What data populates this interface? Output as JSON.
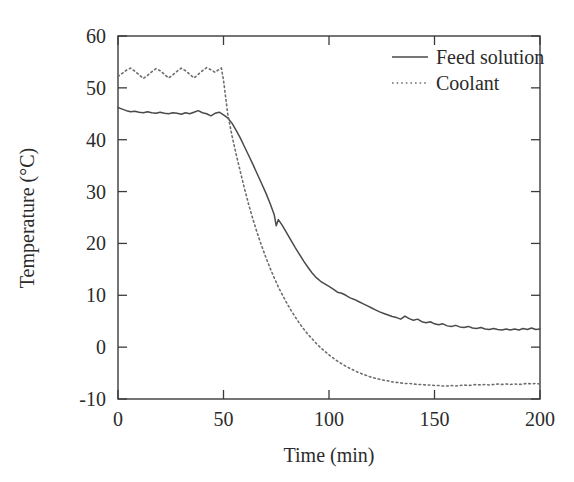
{
  "chart_data": {
    "type": "line",
    "title": "",
    "xlabel": "Time (min)",
    "ylabel": "Temperature (°C)",
    "xlim": [
      0,
      200
    ],
    "ylim": [
      -10,
      60
    ],
    "xticks": [
      0,
      50,
      100,
      150,
      200
    ],
    "yticks": [
      -10,
      0,
      10,
      20,
      30,
      40,
      50,
      60
    ],
    "xtick_labels": [
      "0",
      "50",
      "100",
      "150",
      "200"
    ],
    "ytick_labels": [
      "-10",
      "0",
      "10",
      "20",
      "30",
      "40",
      "50",
      "60"
    ],
    "grid": false,
    "legend_position": "top-right",
    "series": [
      {
        "name": "Feed solution",
        "style": "solid",
        "color": "#4a4a4a",
        "x": [
          0,
          2,
          4,
          6,
          8,
          10,
          12,
          14,
          16,
          18,
          20,
          22,
          24,
          26,
          28,
          30,
          32,
          34,
          36,
          38,
          40,
          42,
          44,
          46,
          48,
          50,
          52,
          54,
          56,
          58,
          60,
          62,
          64,
          66,
          68,
          70,
          72,
          74,
          75,
          76,
          78,
          80,
          82,
          84,
          86,
          88,
          90,
          92,
          94,
          96,
          98,
          100,
          102,
          104,
          106,
          108,
          110,
          112,
          114,
          116,
          118,
          120,
          122,
          124,
          126,
          128,
          130,
          132,
          134,
          136,
          138,
          140,
          142,
          144,
          146,
          148,
          150,
          152,
          154,
          156,
          158,
          160,
          162,
          164,
          166,
          168,
          170,
          172,
          174,
          176,
          178,
          180,
          182,
          184,
          186,
          188,
          190,
          192,
          194,
          196,
          198,
          200
        ],
        "y": [
          46.2,
          45.9,
          45.6,
          45.4,
          45.5,
          45.3,
          45.2,
          45.4,
          45.2,
          45.1,
          45.3,
          45.1,
          45.0,
          45.2,
          45.1,
          44.9,
          45.2,
          45.0,
          45.3,
          45.6,
          45.2,
          45.0,
          44.6,
          45.1,
          45.3,
          44.8,
          44.2,
          43.2,
          41.8,
          40.3,
          38.6,
          36.9,
          35.2,
          33.4,
          31.6,
          29.8,
          27.8,
          25.6,
          23.4,
          24.6,
          23.4,
          22.0,
          20.6,
          19.2,
          17.9,
          16.6,
          15.4,
          14.3,
          13.4,
          12.7,
          12.2,
          11.7,
          11.2,
          10.6,
          10.4,
          10.0,
          9.5,
          9.2,
          8.8,
          8.4,
          8.0,
          7.6,
          7.2,
          6.8,
          6.5,
          6.2,
          5.9,
          5.7,
          5.4,
          6.0,
          5.5,
          5.2,
          5.4,
          4.9,
          4.7,
          4.9,
          4.5,
          4.3,
          4.5,
          4.1,
          4.0,
          4.2,
          3.9,
          3.8,
          4.0,
          3.7,
          3.6,
          3.8,
          3.5,
          3.4,
          3.6,
          3.4,
          3.3,
          3.5,
          3.3,
          3.5,
          3.3,
          3.6,
          3.4,
          3.7,
          3.4,
          3.5
        ]
      },
      {
        "name": "Coolant",
        "style": "dotted",
        "color": "#6d6d6d",
        "x": [
          0,
          2,
          4,
          6,
          8,
          10,
          12,
          14,
          16,
          18,
          20,
          22,
          24,
          26,
          28,
          30,
          32,
          34,
          36,
          38,
          40,
          42,
          44,
          46,
          48,
          49,
          50,
          52,
          54,
          56,
          58,
          60,
          62,
          64,
          66,
          68,
          70,
          72,
          74,
          76,
          78,
          80,
          82,
          84,
          86,
          88,
          90,
          92,
          94,
          96,
          98,
          100,
          102,
          104,
          106,
          108,
          110,
          112,
          114,
          116,
          118,
          120,
          122,
          124,
          126,
          128,
          130,
          132,
          134,
          136,
          138,
          140,
          142,
          144,
          146,
          148,
          150,
          152,
          154,
          156,
          158,
          160,
          162,
          164,
          166,
          168,
          170,
          172,
          174,
          176,
          178,
          180,
          182,
          184,
          186,
          188,
          190,
          192,
          194,
          196,
          198,
          200
        ],
        "y": [
          52.2,
          52.8,
          53.4,
          53.8,
          53.2,
          52.5,
          51.8,
          52.4,
          53.1,
          53.7,
          53.3,
          52.6,
          51.9,
          52.5,
          53.2,
          53.8,
          53.3,
          52.6,
          51.9,
          52.6,
          53.3,
          53.9,
          53.5,
          53.0,
          53.6,
          53.8,
          51.5,
          45.0,
          40.8,
          37.2,
          33.8,
          30.5,
          27.4,
          24.6,
          22.0,
          19.6,
          17.4,
          15.3,
          13.4,
          11.6,
          10.0,
          8.5,
          7.1,
          5.8,
          4.6,
          3.5,
          2.5,
          1.6,
          0.7,
          -0.1,
          -0.8,
          -1.5,
          -2.1,
          -2.7,
          -3.2,
          -3.7,
          -4.1,
          -4.5,
          -4.9,
          -5.2,
          -5.5,
          -5.8,
          -6.0,
          -6.2,
          -6.4,
          -6.5,
          -6.7,
          -6.8,
          -6.9,
          -7.0,
          -7.0,
          -7.1,
          -7.2,
          -7.2,
          -7.3,
          -7.3,
          -7.4,
          -7.4,
          -7.5,
          -7.5,
          -7.4,
          -7.5,
          -7.4,
          -7.3,
          -7.4,
          -7.3,
          -7.2,
          -7.3,
          -7.2,
          -7.3,
          -7.2,
          -7.1,
          -7.2,
          -7.1,
          -7.2,
          -7.1,
          -7.2,
          -7.1,
          -7.0,
          -7.1,
          -7.0,
          -7.1
        ]
      }
    ]
  },
  "legend": {
    "entries": [
      {
        "label": "Feed solution",
        "style": "solid"
      },
      {
        "label": "Coolant",
        "style": "dotted"
      }
    ]
  },
  "colors": {
    "background": "#ffffff",
    "axis": "#3b3b3b",
    "feed_solution": "#4a4a4a",
    "coolant": "#6d6d6d"
  }
}
